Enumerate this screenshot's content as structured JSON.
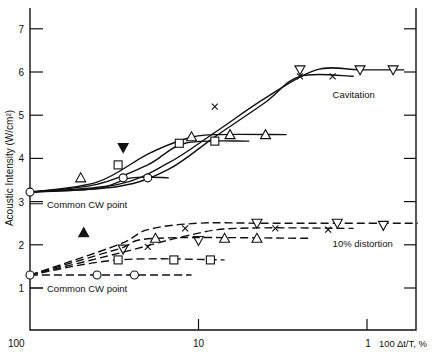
{
  "chart_data": {
    "type": "line",
    "title": "",
    "xlabel": "100 Δt/T, %",
    "ylabel": "Acoustic Intensity (W/cm²)",
    "x_scale": "log",
    "x_reversed": true,
    "xlim": [
      100,
      0.5
    ],
    "ylim": [
      0,
      7.4
    ],
    "x_ticks": [
      "100",
      "10",
      "1"
    ],
    "y_ticks": [
      "1",
      "2",
      "3",
      "4",
      "5",
      "6",
      "7"
    ],
    "annotations": [
      {
        "text": "Cavitation",
        "x": 1.6,
        "y": 5.5
      },
      {
        "text": "10% distortion",
        "x": 1.6,
        "y": 2.05
      },
      {
        "text": "Common CW point",
        "x": 100,
        "y": 2.95
      },
      {
        "text": "Common CW point",
        "x": 100,
        "y": 1.0
      }
    ],
    "groups": [
      {
        "name": "Cavitation",
        "style": "solid",
        "series": [
          {
            "marker": "triangle-down",
            "x": [
              100,
              30,
              15,
              8,
              4,
              2,
              1.1,
              0.6
            ],
            "y": [
              3.22,
              3.4,
              3.9,
              4.6,
              5.4,
              6.05,
              6.05,
              6.05
            ],
            "points": [
              {
                "x": 2.5,
                "y": 6.05
              },
              {
                "x": 1.1,
                "y": 6.05
              },
              {
                "x": 0.7,
                "y": 6.05
              }
            ]
          },
          {
            "marker": "x",
            "x": [
              100,
              30,
              15,
              8,
              4,
              2.5,
              1.2
            ],
            "y": [
              3.22,
              3.35,
              3.75,
              4.5,
              5.3,
              5.9,
              5.9
            ],
            "points": [
              {
                "x": 8,
                "y": 5.2
              },
              {
                "x": 2.5,
                "y": 5.9
              },
              {
                "x": 1.6,
                "y": 5.9
              }
            ]
          },
          {
            "marker": "triangle-up",
            "x": [
              100,
              40,
              20,
              12,
              8,
              3
            ],
            "y": [
              3.22,
              3.45,
              4.1,
              4.45,
              4.55,
              4.55
            ],
            "points": [
              {
                "x": 50,
                "y": 3.55
              },
              {
                "x": 11,
                "y": 4.5
              },
              {
                "x": 6.5,
                "y": 4.55
              },
              {
                "x": 4,
                "y": 4.55
              }
            ]
          },
          {
            "marker": "square",
            "x": [
              100,
              40,
              20,
              12,
              5
            ],
            "y": [
              3.22,
              3.4,
              3.85,
              4.35,
              4.4
            ],
            "points": [
              {
                "x": 13,
                "y": 4.35
              },
              {
                "x": 8,
                "y": 4.4
              }
            ]
          },
          {
            "marker": "circle",
            "x": [
              100,
              40,
              25,
              15
            ],
            "y": [
              3.22,
              3.3,
              3.55,
              3.55
            ],
            "points": [
              {
                "x": 28,
                "y": 3.55
              },
              {
                "x": 20,
                "y": 3.55
              }
            ]
          }
        ]
      },
      {
        "name": "10% distortion",
        "style": "dashed",
        "series": [
          {
            "marker": "triangle-down",
            "x": [
              100,
              30,
              20,
              10,
              4,
              0.5
            ],
            "y": [
              1.3,
              2.0,
              2.35,
              2.5,
              2.5,
              2.5
            ],
            "points": [
              {
                "x": 28,
                "y": 1.9
              },
              {
                "x": 10,
                "y": 2.1
              },
              {
                "x": 4.5,
                "y": 2.5
              },
              {
                "x": 1.5,
                "y": 2.5
              },
              {
                "x": 0.8,
                "y": 2.45
              }
            ]
          },
          {
            "marker": "x",
            "x": [
              100,
              30,
              12,
              6,
              1.2
            ],
            "y": [
              1.3,
              1.8,
              2.2,
              2.38,
              2.38
            ],
            "points": [
              {
                "x": 20,
                "y": 1.95
              },
              {
                "x": 12,
                "y": 2.38
              },
              {
                "x": 3.5,
                "y": 2.38
              },
              {
                "x": 1.7,
                "y": 2.35
              }
            ]
          },
          {
            "marker": "triangle-up",
            "x": [
              100,
              30,
              18,
              2.2
            ],
            "y": [
              1.3,
              1.9,
              2.15,
              2.15
            ],
            "points": [
              {
                "x": 18,
                "y": 2.15
              },
              {
                "x": 7,
                "y": 2.15
              },
              {
                "x": 4.5,
                "y": 2.15
              }
            ]
          },
          {
            "marker": "square",
            "x": [
              100,
              30,
              7
            ],
            "y": [
              1.3,
              1.65,
              1.65
            ],
            "points": [
              {
                "x": 30,
                "y": 1.65
              },
              {
                "x": 14,
                "y": 1.65
              },
              {
                "x": 8.5,
                "y": 1.65
              }
            ]
          },
          {
            "marker": "circle",
            "x": [
              100,
              11
            ],
            "y": [
              1.3,
              1.3
            ],
            "points": [
              {
                "x": 40,
                "y": 1.3
              },
              {
                "x": 24,
                "y": 1.3
              }
            ]
          }
        ]
      }
    ],
    "isolated_points": [
      {
        "marker": "triangle-down-filled",
        "x": 28,
        "y": 4.25
      },
      {
        "marker": "square",
        "x": 30,
        "y": 3.85
      },
      {
        "marker": "triangle-up-filled",
        "x": 48,
        "y": 2.28
      }
    ]
  }
}
